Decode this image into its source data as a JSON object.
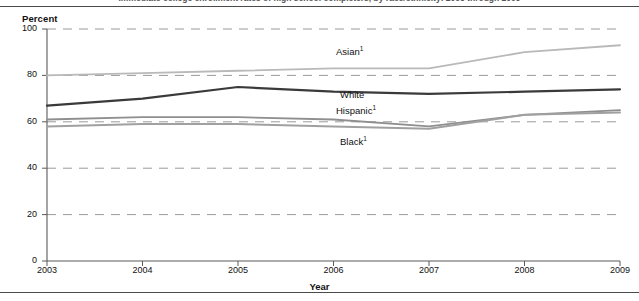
{
  "figure": {
    "title_truncated": "Immediate college enrollment rates of high school completers, by race/ethnicity: 2003 through 2009"
  },
  "chart_data": {
    "type": "line",
    "title": "",
    "xlabel": "Year",
    "ylabel": "Percent",
    "x": [
      2003,
      2004,
      2005,
      2006,
      2007,
      2008,
      2009
    ],
    "categories": [
      "2003",
      "2004",
      "2005",
      "2006",
      "2007",
      "2008",
      "2009"
    ],
    "xlim": [
      2003,
      2009
    ],
    "ylim": [
      0,
      100
    ],
    "yticks": [
      0,
      20,
      40,
      60,
      80,
      100
    ],
    "ytick_labels": [
      "0",
      "20",
      "40",
      "60",
      "80",
      "100"
    ],
    "xticks": [
      2003,
      2004,
      2005,
      2006,
      2007,
      2008,
      2009
    ],
    "xtick_labels": [
      "2003",
      "2004",
      "2005",
      "2006",
      "2007",
      "2008",
      "2009"
    ],
    "grid": "horizontal-dashed",
    "legend": "inline-series-labels",
    "series": [
      {
        "name": "Asian",
        "label": "Asian",
        "footnote": "1",
        "color": "#b9b9b9",
        "width": 1.8,
        "values": [
          80,
          81,
          82,
          83,
          83,
          90,
          93
        ]
      },
      {
        "name": "White",
        "label": "White",
        "footnote": "",
        "color": "#3a3a3a",
        "width": 2.2,
        "values": [
          67,
          70,
          75,
          73,
          72,
          73,
          74
        ]
      },
      {
        "name": "Hispanic",
        "label": "Hispanic",
        "footnote": "1",
        "color": "#8f8f8f",
        "width": 1.8,
        "values": [
          61,
          62,
          62,
          61,
          58,
          63,
          65
        ]
      },
      {
        "name": "Black",
        "label": "Black",
        "footnote": "1",
        "color": "#a0a0a0",
        "width": 2.0,
        "values": [
          58,
          59,
          59,
          58,
          57,
          63,
          64
        ]
      }
    ],
    "series_label_positions": [
      {
        "series": "Asian",
        "x": 336,
        "y": 47
      },
      {
        "series": "White",
        "x": 340,
        "y": 90
      },
      {
        "series": "Hispanic",
        "x": 336,
        "y": 106
      },
      {
        "series": "Black",
        "x": 340,
        "y": 137
      }
    ]
  }
}
